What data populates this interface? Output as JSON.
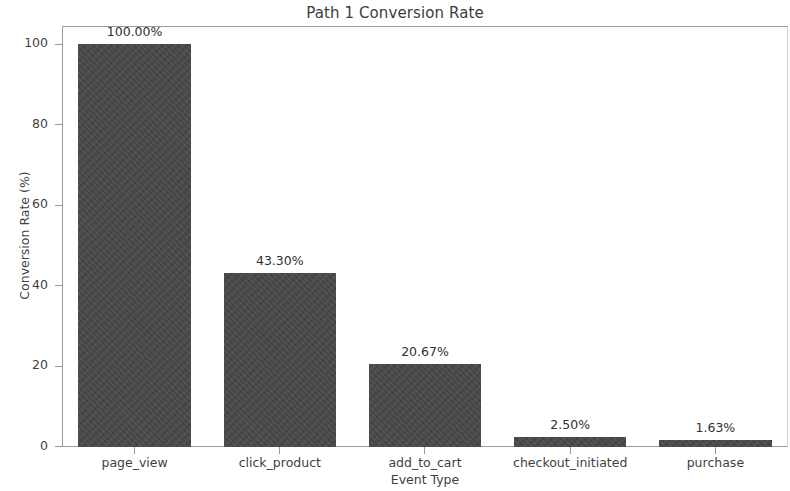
{
  "chart_data": {
    "type": "bar",
    "title": "Path 1 Conversion Rate",
    "xlabel": "Event Type",
    "ylabel": "Conversion Rate (%)",
    "categories": [
      "page_view",
      "click_product",
      "add_to_cart",
      "checkout_initiated",
      "purchase"
    ],
    "values": [
      100.0,
      43.3,
      20.67,
      2.5,
      1.63
    ],
    "value_labels": [
      "100.00%",
      "43.30%",
      "20.67%",
      "2.50%",
      "1.63%"
    ],
    "ylim": [
      0,
      104.5
    ],
    "yticks": [
      0,
      20,
      40,
      60,
      80,
      100
    ],
    "ytick_labels": [
      "0",
      "20",
      "40",
      "60",
      "80",
      "100"
    ],
    "grid": false,
    "legend": null,
    "bar_color": "#474747",
    "axis_color": "#9a9a9a",
    "text_color": "#3f3f3f"
  }
}
